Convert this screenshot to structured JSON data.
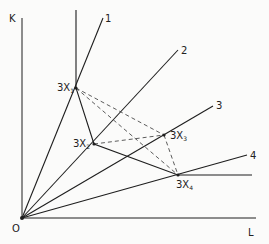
{
  "diagram": {
    "axes": {
      "y_label": "K",
      "x_label": "L",
      "origin_label": "O"
    },
    "rays": [
      {
        "label": "1",
        "end": [
          103,
          18
        ]
      },
      {
        "label": "2",
        "end": [
          178,
          50
        ]
      },
      {
        "label": "3",
        "end": [
          213,
          106
        ]
      },
      {
        "label": "4",
        "end": [
          247,
          155
        ]
      }
    ],
    "points": [
      {
        "id": "X1",
        "label": "3X",
        "sub": "1",
        "x": 76,
        "y": 88
      },
      {
        "id": "X2",
        "label": "3X",
        "sub": "2",
        "x": 94,
        "y": 144
      },
      {
        "id": "X3",
        "label": "3X",
        "sub": "3",
        "x": 164,
        "y": 135
      },
      {
        "id": "X4",
        "label": "3X",
        "sub": "4",
        "x": 178,
        "y": 175
      }
    ],
    "isoquant_solid": [
      "vertical-above-X1",
      "X1-X2",
      "X2-X4",
      "horizontal-right-of-X4"
    ],
    "dashed_segments": [
      [
        "X1",
        "X3"
      ],
      [
        "X1",
        "X4"
      ],
      [
        "X2",
        "X3"
      ],
      [
        "X3",
        "X4"
      ]
    ]
  }
}
